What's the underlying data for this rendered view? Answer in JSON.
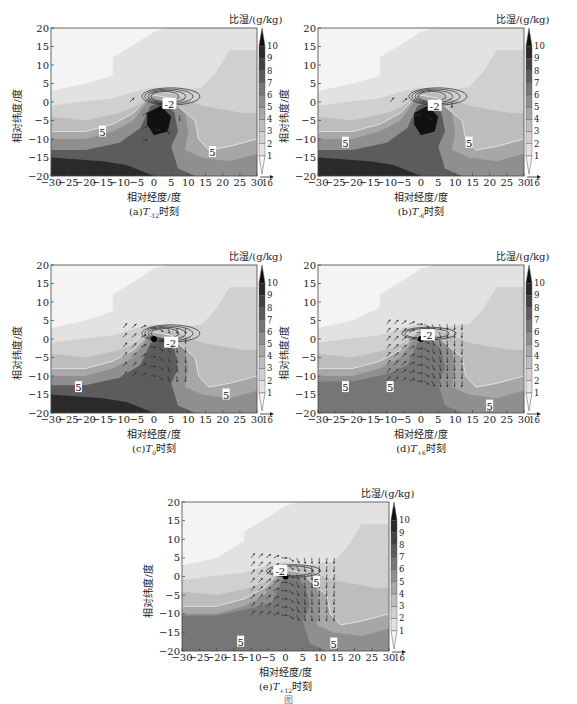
{
  "figure": {
    "caption_fragment": "图"
  },
  "colorbar": {
    "title": "比湿/(g/kg)",
    "ticks": [
      "10",
      "9",
      "8",
      "7",
      "6",
      "5",
      "4",
      "3",
      "2",
      "1"
    ],
    "vector_ref_label": "16",
    "shades": [
      "#f4f4f4",
      "#e2e2e2",
      "#d0d0d0",
      "#bdbdbd",
      "#a7a7a7",
      "#8f8f8f",
      "#767676",
      "#5c5c5c",
      "#424242",
      "#2a2a2a",
      "#111111"
    ]
  },
  "axes": {
    "xlabel": "相对经度/度",
    "ylabel": "相对纬度/度",
    "xticks": [
      "-30",
      "-25",
      "-20",
      "-15",
      "-10",
      "-5",
      "0",
      "5",
      "10",
      "15",
      "20",
      "25",
      "30"
    ],
    "yticks": [
      "20",
      "15",
      "10",
      "5",
      "0",
      "-5",
      "-10",
      "-15",
      "-20"
    ]
  },
  "chart_data": [
    {
      "type": "heatmap",
      "panel": "a",
      "caption_prefix": "(a)",
      "caption_T": "T",
      "caption_sub": "-12",
      "caption_suffix": "时刻",
      "title": "(a)T-12时刻",
      "xlabel": "相对经度/度",
      "ylabel": "相对纬度/度",
      "xlim": [
        -30,
        30
      ],
      "ylim": [
        -20,
        20
      ],
      "colorbar_label": "比湿/(g/kg)",
      "colorbar_range": [
        1,
        10
      ],
      "contour_labels": [
        {
          "x": 4.5,
          "y": -0.5,
          "text": "-2"
        },
        {
          "x": -15,
          "y": -8,
          "text": "5"
        },
        {
          "x": 17,
          "y": -13.5,
          "text": "5"
        }
      ],
      "center_marker": null,
      "vector_region": {
        "x": [
          -7,
          8
        ],
        "y": [
          -11,
          0
        ],
        "density": "sparse"
      }
    },
    {
      "type": "heatmap",
      "panel": "b",
      "caption_prefix": "(b)",
      "caption_T": "T",
      "caption_sub": "-6",
      "caption_suffix": "时刻",
      "title": "(b)T-6时刻",
      "xlabel": "相对经度/度",
      "ylabel": "相对纬度/度",
      "xlim": [
        -30,
        30
      ],
      "ylim": [
        -20,
        20
      ],
      "colorbar_label": "比湿/(g/kg)",
      "colorbar_range": [
        1,
        10
      ],
      "contour_labels": [
        {
          "x": 4,
          "y": -1,
          "text": "-2"
        },
        {
          "x": -22,
          "y": -11,
          "text": "5"
        },
        {
          "x": 14,
          "y": -11,
          "text": "5"
        }
      ],
      "center_marker": null,
      "vector_region": {
        "x": [
          -9,
          10
        ],
        "y": [
          -7,
          0
        ],
        "density": "sparse"
      }
    },
    {
      "type": "heatmap",
      "panel": "c",
      "caption_prefix": "(c)",
      "caption_T": "T",
      "caption_sub": "0",
      "caption_suffix": "时刻",
      "title": "(c)T0时刻",
      "xlabel": "相对经度/度",
      "ylabel": "相对纬度/度",
      "xlim": [
        -30,
        30
      ],
      "ylim": [
        -20,
        20
      ],
      "colorbar_label": "比湿/(g/kg)",
      "colorbar_range": [
        1,
        10
      ],
      "contour_labels": [
        {
          "x": 5,
          "y": -1,
          "text": "-2"
        },
        {
          "x": -22,
          "y": -13,
          "text": "5"
        },
        {
          "x": 21,
          "y": -15,
          "text": "5"
        }
      ],
      "center_marker": {
        "x": 0,
        "y": 0
      },
      "vector_region": {
        "x": [
          -9,
          10
        ],
        "y": [
          -10,
          3
        ],
        "density": "medium"
      }
    },
    {
      "type": "heatmap",
      "panel": "d",
      "caption_prefix": "(d)",
      "caption_T": "T",
      "caption_sub": "+6",
      "caption_suffix": "时刻",
      "title": "(d)T+6时刻",
      "xlabel": "相对经度/度",
      "ylabel": "相对纬度/度",
      "xlim": [
        -30,
        30
      ],
      "ylim": [
        -20,
        20
      ],
      "colorbar_label": "比湿/(g/kg)",
      "colorbar_range": [
        1,
        10
      ],
      "contour_labels": [
        {
          "x": 2,
          "y": 1,
          "text": "-2"
        },
        {
          "x": -22,
          "y": -13,
          "text": "5"
        },
        {
          "x": -9,
          "y": -13,
          "text": "5"
        },
        {
          "x": 20,
          "y": -18,
          "text": "5"
        }
      ],
      "center_marker": {
        "x": 0,
        "y": 0
      },
      "vector_region": {
        "x": [
          -10,
          12
        ],
        "y": [
          -12,
          4
        ],
        "density": "dense"
      }
    },
    {
      "type": "heatmap",
      "panel": "e",
      "caption_prefix": "(e)",
      "caption_T": "T",
      "caption_sub": "+12",
      "caption_suffix": "时刻",
      "title": "(e)T+12时刻",
      "xlabel": "相对经度/度",
      "ylabel": "相对纬度/度",
      "xlim": [
        -30,
        30
      ],
      "ylim": [
        -20,
        20
      ],
      "colorbar_label": "比湿/(g/kg)",
      "colorbar_range": [
        1,
        10
      ],
      "contour_labels": [
        {
          "x": -1.5,
          "y": 1.5,
          "text": "-2"
        },
        {
          "x": 9,
          "y": -1.5,
          "text": "5"
        },
        {
          "x": -13,
          "y": -17.5,
          "text": "5"
        },
        {
          "x": 14,
          "y": -18,
          "text": "5"
        }
      ],
      "center_marker": {
        "x": 0,
        "y": 0
      },
      "vector_region": {
        "x": [
          -10,
          16
        ],
        "y": [
          -12,
          5
        ],
        "density": "dense"
      }
    }
  ],
  "layout": {
    "panels": [
      {
        "left": 51,
        "top": 28,
        "width": 206,
        "height": 148
      },
      {
        "left": 318,
        "top": 28,
        "width": 206,
        "height": 148
      },
      {
        "left": 51,
        "top": 265,
        "width": 206,
        "height": 148
      },
      {
        "left": 318,
        "top": 265,
        "width": 206,
        "height": 148
      },
      {
        "left": 182,
        "top": 502,
        "width": 207,
        "height": 149
      }
    ]
  }
}
